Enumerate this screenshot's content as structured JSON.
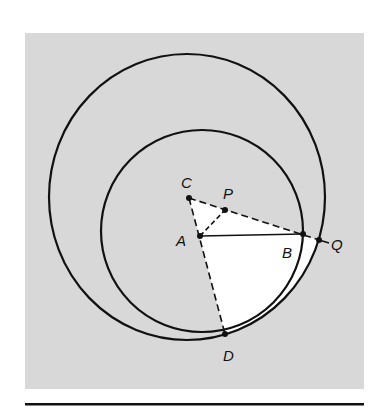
{
  "figure": {
    "background_color": "#ffffff",
    "panel_color": "#d8d8d8",
    "highlight_color": "#ffffff",
    "stroke_color": "#111111"
  },
  "points": {
    "C": {
      "label": "C",
      "x": 189,
      "y": 198,
      "label_x": 186,
      "label_y": 188
    },
    "P": {
      "label": "P",
      "x": 225,
      "y": 210,
      "label_x": 228,
      "label_y": 199
    },
    "A": {
      "label": "A",
      "x": 200,
      "y": 236,
      "label_x": 179,
      "label_y": 246
    },
    "B": {
      "label": "B",
      "x": 303,
      "y": 234,
      "label_x": 286,
      "label_y": 258
    },
    "Q": {
      "label": "Q",
      "x": 319,
      "y": 240,
      "label_x": 332,
      "label_y": 250
    },
    "D": {
      "label": "D",
      "x": 225,
      "y": 334,
      "label_x": 224,
      "label_y": 361
    }
  },
  "circles": {
    "large": {
      "cx": 187,
      "cy": 197,
      "rx": 138,
      "ry": 143
    },
    "small": {
      "cx": 202,
      "cy": 231,
      "r": 101
    }
  },
  "segments": [
    {
      "from": "C",
      "to": "Q",
      "style": "dashed"
    },
    {
      "from": "C",
      "to": "D",
      "style": "dashed"
    },
    {
      "from": "A",
      "to": "P",
      "style": "dashed"
    },
    {
      "from": "A",
      "to": "B",
      "style": "solid"
    },
    {
      "from": "Q",
      "to": "Q_ext",
      "style": "solid"
    }
  ]
}
